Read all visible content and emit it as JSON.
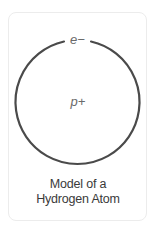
{
  "diagram": {
    "title": "Model of a Hydrogen Atom",
    "caption_lines": [
      "Model of a",
      "Hydrogen Atom"
    ],
    "electron_label": "e−",
    "nucleus_label": "p+",
    "orbit": {
      "center_x": 77.5,
      "center_y": 102,
      "radius": 62,
      "stroke_color": "#4a4a4a",
      "stroke_width": 2.2
    },
    "label_color": "#6a6a6a",
    "caption_color": "#3a3a3a",
    "card_border_color": "#ececec"
  }
}
